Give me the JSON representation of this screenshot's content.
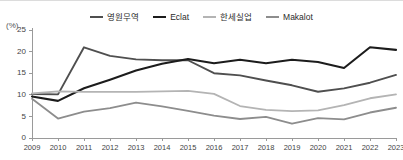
{
  "chart_data": {
    "type": "line",
    "title": "",
    "subtitle": "",
    "xlabel": "",
    "ylabel": "(%)",
    "unit_label": "(%)",
    "legend_position": "top-center",
    "grid": false,
    "ylim": [
      0,
      25
    ],
    "xlim": [
      2009,
      2023
    ],
    "yticks": [
      0,
      5,
      10,
      15,
      20,
      25
    ],
    "ytick_labels": [
      "0",
      "5",
      "10",
      "15",
      "20",
      "25"
    ],
    "categories": [
      2009,
      2010,
      2011,
      2012,
      2013,
      2014,
      2015,
      2016,
      2017,
      2018,
      2019,
      2020,
      2021,
      2022,
      2023
    ],
    "xtick_labels": [
      "2009",
      "2010",
      "2011",
      "2012",
      "2013",
      "2014",
      "2015",
      "2016",
      "2017",
      "2018",
      "2019",
      "2020",
      "2021",
      "2022",
      "2023"
    ],
    "series": [
      {
        "name": "영원무역",
        "color": "#4f4f4f",
        "width": 1.9,
        "values": [
          10.2,
          10.1,
          21.0,
          19.0,
          18.2,
          18.0,
          18.0,
          15.0,
          14.5,
          13.3,
          12.2,
          10.7,
          11.5,
          12.8,
          14.6
        ]
      },
      {
        "name": "Eclat",
        "color": "#1c1c1c",
        "width": 2.1,
        "values": [
          9.6,
          8.6,
          11.5,
          13.5,
          15.6,
          17.2,
          18.3,
          17.3,
          18.1,
          17.3,
          18.1,
          17.6,
          16.2,
          21.0,
          20.4
        ]
      },
      {
        "name": "한세실업",
        "color": "#b4b4b4",
        "width": 1.8,
        "values": [
          10.3,
          10.8,
          10.7,
          10.7,
          10.7,
          10.8,
          10.9,
          10.2,
          7.4,
          6.5,
          6.2,
          6.4,
          7.6,
          9.2,
          10.1
        ]
      },
      {
        "name": "Makalot",
        "color": "#8d8d8d",
        "width": 1.8,
        "values": [
          9.1,
          4.5,
          6.1,
          6.9,
          8.2,
          7.3,
          6.3,
          5.2,
          4.4,
          4.9,
          3.3,
          4.6,
          4.3,
          5.9,
          7.0
        ]
      }
    ]
  },
  "legend": {
    "items": [
      {
        "label": "영원무역",
        "color": "#4f4f4f"
      },
      {
        "label": "Eclat",
        "color": "#1c1c1c"
      },
      {
        "label": "한세실업",
        "color": "#b4b4b4"
      },
      {
        "label": "Makalot",
        "color": "#8d8d8d"
      }
    ]
  },
  "axis": {
    "unit": "(%)",
    "line_color": "#9a9a9a"
  }
}
